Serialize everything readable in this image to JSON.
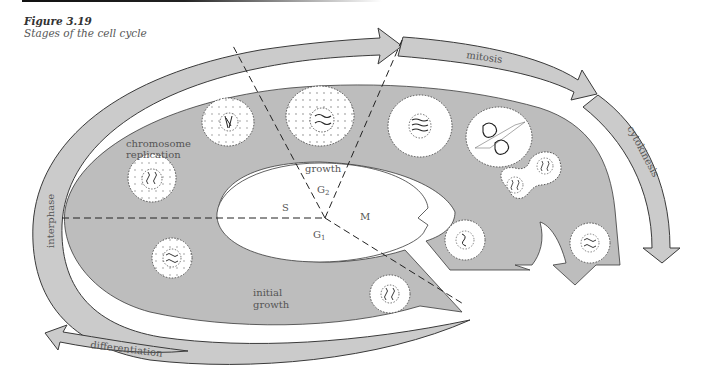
{
  "figure": {
    "number": "Figure 3.19",
    "title": "Stages of the cell cycle"
  },
  "arrows": {
    "interphase": "interphase",
    "mitosis": "mitosis",
    "cytokinesis": "cytokinesis",
    "differentiation": "differentiation"
  },
  "phases": {
    "S": "S",
    "G2": "G",
    "G2_sub": "2",
    "M": "M",
    "G1": "G",
    "G1_sub": "1"
  },
  "region_labels": {
    "chromosome_replication_line1": "chromosome",
    "chromosome_replication_line2": "replication",
    "growth": "growth",
    "initial_growth_line1": "initial",
    "initial_growth_line2": "growth"
  },
  "colors": {
    "band_gray": "#c8c8c8",
    "inner_gray": "#bdbdbd",
    "outline": "#3a3a3a",
    "text": "#555555"
  }
}
